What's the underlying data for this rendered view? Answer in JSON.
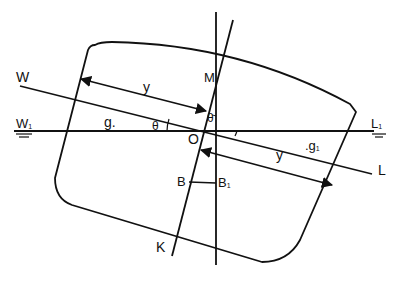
{
  "diagram": {
    "labels": {
      "W": "W",
      "W1": "W",
      "W1_sub": "1",
      "L": "L",
      "L1": "L",
      "L1_sub": "1",
      "M": "M",
      "O": "O",
      "B": "B",
      "B1": "B",
      "B1_sub": "1",
      "K": "K",
      "g": "g.",
      "g1": ".g",
      "g1_sub": "1",
      "y_left": "y",
      "y_right": "y",
      "theta_left": "θ",
      "theta_top": "θ"
    },
    "colors": {
      "stroke": "#111111",
      "background": "#ffffff"
    }
  }
}
